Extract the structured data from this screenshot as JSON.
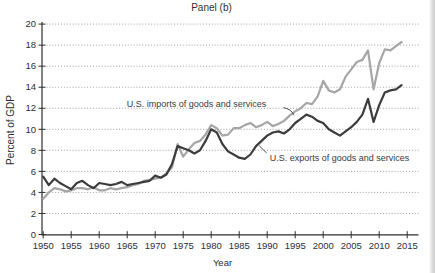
{
  "chart_data": {
    "type": "line",
    "title": "Panel (b)",
    "xlabel": "Year",
    "ylabel": "Percent of GDP",
    "x_range": [
      1950,
      2017
    ],
    "y_range": [
      0,
      20
    ],
    "x_ticks": [
      1950,
      1955,
      1960,
      1965,
      1970,
      1975,
      1980,
      1985,
      1990,
      1995,
      2000,
      2005,
      2010,
      2015
    ],
    "y_ticks": [
      0,
      2,
      4,
      6,
      8,
      10,
      12,
      14,
      16,
      18,
      20
    ],
    "grid": "horizontal dotted lines at every y tick",
    "legend": "in-plot text annotations with pointer lines",
    "colors": {
      "imports_line": "#a6a6a6",
      "exports_line": "#3c3c3c",
      "axis": "#2e2e2e",
      "grid": "#949494",
      "annotation_text": "#3a3a3a"
    },
    "years": [
      1950,
      1951,
      1952,
      1953,
      1954,
      1955,
      1956,
      1957,
      1958,
      1959,
      1960,
      1961,
      1962,
      1963,
      1964,
      1965,
      1966,
      1967,
      1968,
      1969,
      1970,
      1971,
      1972,
      1973,
      1974,
      1975,
      1976,
      1977,
      1978,
      1979,
      1980,
      1981,
      1982,
      1983,
      1984,
      1985,
      1986,
      1987,
      1988,
      1989,
      1990,
      1991,
      1992,
      1993,
      1994,
      1995,
      1996,
      1997,
      1998,
      1999,
      2000,
      2001,
      2002,
      2003,
      2004,
      2005,
      2006,
      2007,
      2008,
      2009,
      2010,
      2011,
      2012,
      2013,
      2014
    ],
    "series": [
      {
        "key": "imports-line",
        "name": "U.S. imports of goods and services",
        "color": "#a6a6a6",
        "values": [
          3.4,
          4.0,
          4.4,
          4.3,
          4.1,
          4.2,
          4.4,
          4.4,
          4.3,
          4.5,
          4.2,
          4.2,
          4.4,
          4.3,
          4.4,
          4.5,
          4.7,
          4.8,
          5.1,
          5.2,
          5.3,
          5.4,
          5.8,
          6.4,
          8.6,
          7.4,
          8.1,
          8.7,
          8.9,
          9.5,
          10.4,
          10.1,
          9.4,
          9.5,
          10.1,
          10.1,
          10.4,
          10.6,
          10.2,
          10.4,
          10.7,
          10.3,
          10.5,
          10.8,
          11.3,
          11.7,
          12.0,
          12.5,
          12.4,
          13.1,
          14.6,
          13.7,
          13.5,
          13.8,
          15.0,
          15.7,
          16.4,
          16.6,
          17.5,
          13.8,
          16.3,
          17.6,
          17.5,
          17.9,
          18.3
        ]
      },
      {
        "key": "exports-line",
        "name": "U.S. exports of goods and services",
        "color": "#3c3c3c",
        "values": [
          5.5,
          4.7,
          5.3,
          4.9,
          4.6,
          4.3,
          4.9,
          5.1,
          4.7,
          4.4,
          4.9,
          4.8,
          4.7,
          4.8,
          5.0,
          4.7,
          4.8,
          4.9,
          5.0,
          5.1,
          5.6,
          5.4,
          5.7,
          6.7,
          8.4,
          8.2,
          8.0,
          7.7,
          8.0,
          8.9,
          10.0,
          9.7,
          8.6,
          7.9,
          7.6,
          7.3,
          7.2,
          7.6,
          8.4,
          8.9,
          9.4,
          9.7,
          9.8,
          9.6,
          10.0,
          10.6,
          11.0,
          11.4,
          11.2,
          10.8,
          10.6,
          10.0,
          9.7,
          9.4,
          9.8,
          10.2,
          10.7,
          11.4,
          12.9,
          10.7,
          12.3,
          13.5,
          13.7,
          13.8,
          14.2
        ]
      }
    ],
    "annotations": [
      {
        "key": "imports-series-label",
        "text": "U.S. imports of goods and services",
        "label_year": 1964.9,
        "label_value": 12.45,
        "pointer": {
          "shape": "curve",
          "from": [
            1992.9,
            12.05
          ],
          "to": [
            1994.8,
            11.35
          ]
        }
      },
      {
        "key": "exports-series-label",
        "text": "U.S. exports of goods and services",
        "label_year": 1990.45,
        "label_value": 7.3,
        "pointer": {
          "shape": "line",
          "from": [
            1989.9,
            7.75
          ],
          "to": [
            1988.55,
            8.45
          ]
        }
      }
    ]
  }
}
